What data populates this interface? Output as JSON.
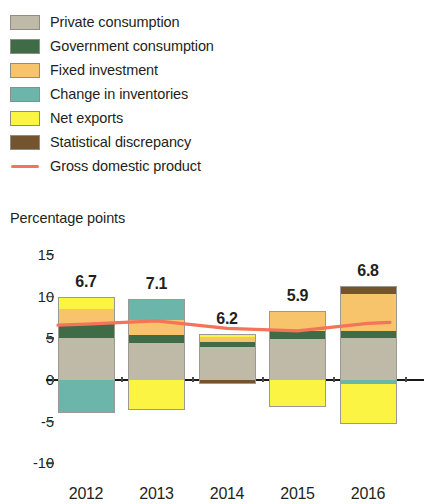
{
  "legend": {
    "items": [
      {
        "label": "Private consumption",
        "color": "#bfbaa8",
        "type": "swatch",
        "icon": "square-swatch-icon"
      },
      {
        "label": "Government consumption",
        "color": "#3f6b46",
        "type": "swatch",
        "icon": "square-swatch-icon"
      },
      {
        "label": "Fixed investment",
        "color": "#f7c46c",
        "type": "swatch",
        "icon": "square-swatch-icon"
      },
      {
        "label": "Change in inventories",
        "color": "#6bb5ab",
        "type": "swatch",
        "icon": "square-swatch-icon"
      },
      {
        "label": "Net exports",
        "color": "#fbf443",
        "type": "swatch",
        "icon": "square-swatch-icon"
      },
      {
        "label": "Statistical discrepancy",
        "color": "#73542f",
        "type": "swatch",
        "icon": "square-swatch-icon"
      },
      {
        "label": "Gross domestic product",
        "color": "#f4735a",
        "type": "line",
        "icon": "line-swatch-icon"
      }
    ]
  },
  "axis_title": "Percentage points",
  "chart_data": {
    "type": "bar",
    "title": "",
    "subtitle": "",
    "xlabel": "",
    "ylabel": "Percentage points",
    "ylim": [
      -10,
      15
    ],
    "yticks": [
      15,
      10,
      5,
      0,
      -5,
      -10
    ],
    "ytick_labels": [
      "15",
      "10",
      "5",
      "0",
      "-5",
      "-10"
    ],
    "grid": false,
    "legend_position": "top-left",
    "stacked": true,
    "categories": [
      "2012",
      "2013",
      "2014",
      "2015",
      "2016"
    ],
    "series": [
      {
        "name": "Private consumption",
        "color": "#bfbaa8",
        "values": [
          5.0,
          4.4,
          4.0,
          4.9,
          5.0
        ]
      },
      {
        "name": "Government consumption",
        "color": "#3f6b46",
        "values": [
          1.7,
          1.0,
          0.5,
          1.0,
          0.9
        ]
      },
      {
        "name": "Fixed investment",
        "color": "#f7c46c",
        "values": [
          1.8,
          1.8,
          0.7,
          2.4,
          4.4
        ]
      },
      {
        "name": "Change in inventories",
        "color": "#6bb5ab",
        "values": [
          -3.9,
          2.5,
          0.0,
          0.0,
          -0.5
        ]
      },
      {
        "name": "Net exports",
        "color": "#fbf443",
        "values": [
          1.5,
          -3.6,
          0.3,
          -3.2,
          -4.8
        ]
      },
      {
        "name": "Statistical discrepancy",
        "color": "#73542f",
        "values": [
          0.0,
          0.0,
          -0.5,
          0.0,
          1.0
        ]
      }
    ],
    "line_series": {
      "name": "Gross domestic product",
      "color": "#f4735a",
      "values": [
        6.7,
        7.1,
        6.2,
        5.9,
        6.8
      ],
      "data_labels": [
        "6.7",
        "7.1",
        "6.2",
        "5.9",
        "6.8"
      ]
    }
  }
}
